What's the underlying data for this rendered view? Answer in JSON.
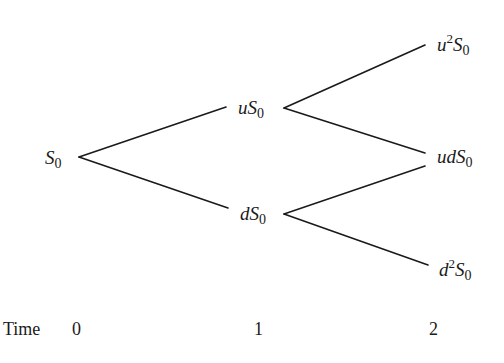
{
  "diagram": {
    "type": "binomial-tree",
    "steps": 2,
    "nodes": [
      {
        "id": "s0",
        "step": 0,
        "base": "S",
        "prefix": "",
        "power": "",
        "sub": "0",
        "text": "S0"
      },
      {
        "id": "us0",
        "step": 1,
        "base": "S",
        "prefix": "u",
        "power": "",
        "sub": "0",
        "text": "uS0"
      },
      {
        "id": "ds0",
        "step": 1,
        "base": "S",
        "prefix": "d",
        "power": "",
        "sub": "0",
        "text": "dS0"
      },
      {
        "id": "u2s0",
        "step": 2,
        "base": "S",
        "prefix": "u",
        "power": "2",
        "sub": "0",
        "text": "u^2 S0"
      },
      {
        "id": "uds0",
        "step": 2,
        "base": "S",
        "prefix": "ud",
        "power": "",
        "sub": "0",
        "text": "udS0"
      },
      {
        "id": "d2s0",
        "step": 2,
        "base": "S",
        "prefix": "d",
        "power": "2",
        "sub": "0",
        "text": "d^2 S0"
      }
    ],
    "edges": [
      {
        "from": "s0",
        "to": "us0"
      },
      {
        "from": "s0",
        "to": "ds0"
      },
      {
        "from": "us0",
        "to": "u2s0"
      },
      {
        "from": "us0",
        "to": "uds0"
      },
      {
        "from": "ds0",
        "to": "uds0"
      },
      {
        "from": "ds0",
        "to": "d2s0"
      }
    ],
    "time_axis": {
      "label": "Time",
      "ticks": [
        "0",
        "1",
        "2"
      ]
    },
    "colors": {
      "ink": "#1a1a1a",
      "background": "#ffffff"
    }
  }
}
